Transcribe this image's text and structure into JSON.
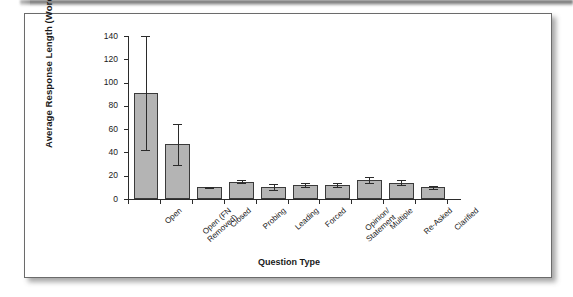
{
  "figure": {
    "panel_background": "#ffffff",
    "page_background": "#ffffff",
    "bar_fill_color": "#b4b4b4",
    "bar_outline_color": "#3a3a3a",
    "axis_color": "#2b2b2b"
  },
  "chart_data": {
    "type": "bar",
    "title": "",
    "xlabel": "Question Type",
    "ylabel": "Average Response Length (Words)",
    "ylim": [
      0,
      140
    ],
    "ytick_labels": [
      "0",
      "20",
      "40",
      "60",
      "80",
      "100",
      "120",
      "140"
    ],
    "ytick_values": [
      0,
      20,
      40,
      60,
      80,
      100,
      120,
      140
    ],
    "grid": false,
    "legend": null,
    "categories": [
      "Open",
      "Open (FN Removed)",
      "Closed",
      "Probing",
      "Leading",
      "Forced",
      "Opinion/ Statement",
      "Multiple",
      "Re-Asked",
      "Clarified"
    ],
    "category_lines": [
      [
        "Open"
      ],
      [
        "Open (FN",
        "Removed)"
      ],
      [
        "Closed"
      ],
      [
        "Probing"
      ],
      [
        "Leading"
      ],
      [
        "Forced"
      ],
      [
        "Opinion/",
        "Statement"
      ],
      [
        "Multiple"
      ],
      [
        "Re-Asked"
      ],
      [
        "Clarified"
      ]
    ],
    "values": [
      91,
      47,
      10,
      15,
      10,
      12,
      12,
      16,
      14,
      10
    ],
    "error_low": [
      42,
      29,
      9.5,
      14,
      8,
      10.5,
      10,
      14,
      12,
      9
    ],
    "error_high": [
      140,
      64,
      10.5,
      16,
      13,
      14,
      14,
      18.5,
      16.5,
      11.5
    ]
  }
}
